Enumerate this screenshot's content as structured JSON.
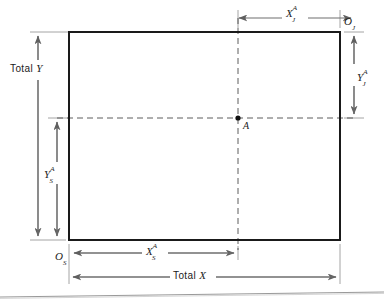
{
  "figure": {
    "kind": "engineering-dimension-diagram",
    "background_color": "#ffffff",
    "line_color": "#6e6e6e",
    "rect_stroke_color": "#1a1a1a",
    "text_color": "#1b1b1b"
  },
  "rect": {
    "x": 69,
    "y": 32,
    "width": 271,
    "height": 208,
    "stroke_width": 2
  },
  "point_a": {
    "label": "A",
    "x": 238,
    "y": 118,
    "dot_radius": 2.6
  },
  "dimensions": [
    {
      "name": "x-j-a",
      "base": "X",
      "sup": "A",
      "sub": "J",
      "orientation": "horizontal",
      "from_x": 238,
      "to_x": 354,
      "y": 18,
      "label_x": 286,
      "label_y": 5
    },
    {
      "name": "y-j-a",
      "base": "Y",
      "sup": "A",
      "sub": "J",
      "orientation": "vertical",
      "x": 354,
      "from_y": 32,
      "to_y": 118,
      "label_x": 358,
      "label_y": 70
    },
    {
      "name": "total-y",
      "text_prefix": "Total",
      "base": "Y",
      "orientation": "vertical",
      "x": 38,
      "from_y": 32,
      "to_y": 240,
      "label_x": 8,
      "label_y": 68
    },
    {
      "name": "y-s-a",
      "base": "Y",
      "sup": "A",
      "sub": "S",
      "orientation": "vertical",
      "x": 57,
      "from_y": 118,
      "to_y": 240,
      "label_x": 44,
      "label_y": 170
    },
    {
      "name": "x-s-a",
      "base": "X",
      "sup": "A",
      "sub": "S",
      "orientation": "horizontal",
      "from_x": 70,
      "to_x": 238,
      "y": 253,
      "label_x": 146,
      "label_y": 243
    },
    {
      "name": "total-x",
      "text_prefix": "Total",
      "base": "X",
      "orientation": "horizontal",
      "from_x": 69,
      "to_x": 340,
      "y": 277,
      "label_x": 173,
      "label_y": 270
    }
  ],
  "origins": [
    {
      "name": "origin-j",
      "base": "O",
      "sub": "J",
      "label_x": 343,
      "label_y": 16
    },
    {
      "name": "origin-s",
      "base": "O",
      "sub": "S",
      "label_x": 56,
      "label_y": 246
    }
  ],
  "labels": {
    "total_word": "Total",
    "x_letter": "X",
    "y_letter": "Y",
    "o_letter": "O",
    "a_letter": "A",
    "j_letter": "J",
    "s_letter": "S",
    "sup_a": "A"
  }
}
